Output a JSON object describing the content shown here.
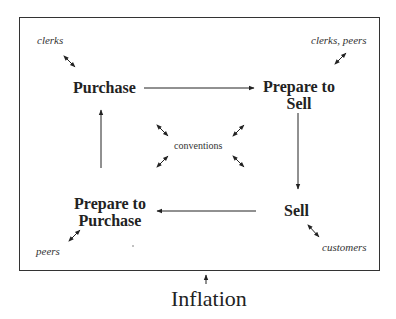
{
  "diagram": {
    "nodes": [
      {
        "id": "purchase",
        "label": "Purchase"
      },
      {
        "id": "prepare_to_sell",
        "label_line1": "Prepare to",
        "label_line2": "Sell"
      },
      {
        "id": "sell",
        "label": "Sell"
      },
      {
        "id": "prepare_to_purchase",
        "label_line1": "Prepare to",
        "label_line2": "Purchase"
      }
    ],
    "actors": {
      "purchase": "clerks",
      "prepare_to_sell": "clerks, peers",
      "sell": "customers",
      "prepare_to_purchase": "peers"
    },
    "center": "conventions",
    "external": "Inflation",
    "edges": [
      {
        "from": "Purchase",
        "to": "Prepare to Sell"
      },
      {
        "from": "Prepare to Sell",
        "to": "Sell"
      },
      {
        "from": "Sell",
        "to": "Prepare to Purchase"
      },
      {
        "from": "Prepare to Purchase",
        "to": "Purchase"
      }
    ]
  }
}
